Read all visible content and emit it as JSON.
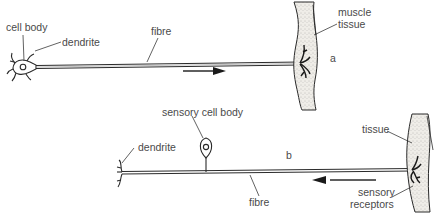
{
  "diagram": {
    "panel_a": {
      "id_label": "a",
      "labels": {
        "cell_body": "cell body",
        "dendrite": "dendrite",
        "fibre": "fibre",
        "muscle_tissue_line1": "muscle",
        "muscle_tissue_line2": "tissue"
      },
      "arrow_direction": "right"
    },
    "panel_b": {
      "id_label": "b",
      "labels": {
        "sensory_cell_body": "sensory  cell body",
        "dendrite": "dendrite",
        "fibre": "fibre",
        "tissue": "tissue",
        "sensory_receptors_line1": "sensory",
        "sensory_receptors_line2": "receptors"
      },
      "arrow_direction": "left"
    },
    "colors": {
      "ink": "#2a2a2a",
      "label": "#4a4a4a",
      "tissue_fill": "#e6e3dd",
      "background": "#ffffff"
    }
  }
}
